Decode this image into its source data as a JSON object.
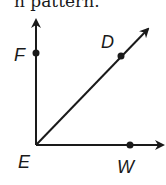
{
  "caption": "n pattern.",
  "diagram": {
    "vertex": {
      "label": "E",
      "x": 36,
      "y": 145
    },
    "points": [
      {
        "label": "F",
        "x": 36,
        "y": 53
      },
      {
        "label": "D",
        "x": 121,
        "y": 56
      },
      {
        "label": "W",
        "x": 130,
        "y": 145
      }
    ],
    "rays": [
      {
        "name": "ray-EF",
        "to": [
          36,
          18
        ]
      },
      {
        "name": "ray-ED",
        "to": [
          150,
          27
        ]
      },
      {
        "name": "ray-EW",
        "to": [
          165,
          145
        ]
      }
    ],
    "color": "#1a1a1a"
  }
}
